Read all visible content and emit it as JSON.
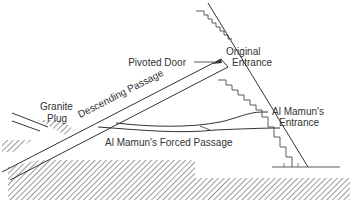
{
  "diagram": {
    "title": "",
    "labels": {
      "pivoted_door": "Pivoted Door",
      "original_entrance_line1": "Original",
      "original_entrance_line2": "Entrance",
      "granite_plug_line1": "Granite",
      "granite_plug_line2": "Plug",
      "descending_passage": "Descending Passage",
      "al_mamun_entrance_line1": "Al Mamun's",
      "al_mamun_entrance_line2": "Entrance",
      "al_mamun_forced_passage": "Al Mamun's Forced Passage"
    },
    "colors": {
      "line": "#333333",
      "hatch": "#555555",
      "background": "#ffffff"
    }
  }
}
